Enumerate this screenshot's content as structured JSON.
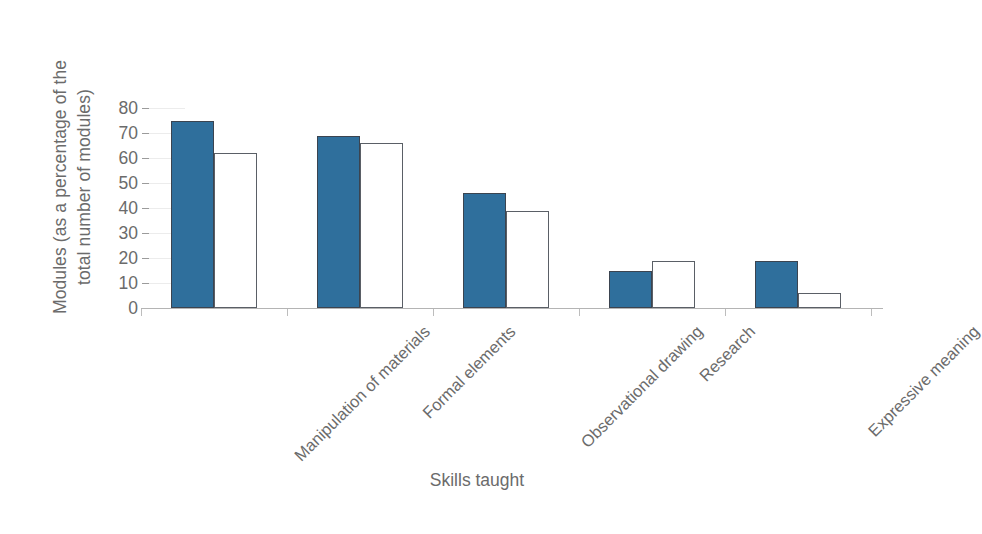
{
  "chart_data": {
    "type": "bar",
    "title": "",
    "xlabel": "Skills taught",
    "ylabel": "Modules (as a percentage of the total number of modules)",
    "categories": [
      "Manipulation of materials",
      "Formal elements",
      "Observational drawing",
      "Research",
      "Expressive meaning"
    ],
    "series": [
      {
        "name": "Series 1",
        "style": "filled",
        "color": "#2f6f9c",
        "values": [
          75,
          69,
          46,
          15,
          19
        ]
      },
      {
        "name": "Series 2",
        "style": "hollow",
        "color": "#ffffff",
        "values": [
          62,
          66,
          39,
          19,
          6
        ]
      }
    ],
    "ylim": [
      0,
      80
    ],
    "yticks": [
      0,
      10,
      20,
      30,
      40,
      50,
      60,
      70,
      80
    ],
    "ytick_labels": [
      "0",
      "10",
      "20",
      "30",
      "40",
      "50",
      "60",
      "70",
      "80"
    ],
    "grid": "faint-horizontal",
    "legend": "none",
    "xtick_label_rotation": -45
  },
  "axes": {
    "y_title_line1": "Modules (as a percentage of the",
    "y_title_line2": "total number of modules)",
    "x_title": "Skills taught"
  },
  "colors": {
    "bar_filled": "#2f6f9c",
    "bar_filled_edge": "#3b4450",
    "bar_hollow_fill": "#ffffff",
    "bar_hollow_edge": "#5a5f66",
    "text": "#6b6b6b",
    "axis": "#b4b4b4",
    "gridline": "#ececec",
    "background": "#ffffff"
  }
}
